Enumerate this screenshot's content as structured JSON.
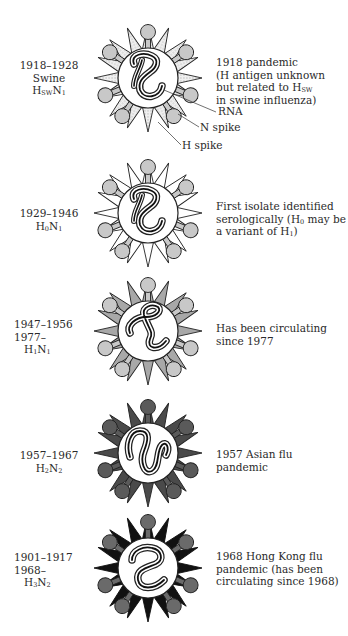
{
  "figure": {
    "entries": [
      {
        "years": [
          "1918–1928"
        ],
        "strain_line": "Swine",
        "subtype": {
          "h": "H",
          "h_sub": "SW",
          "n": "N",
          "n_sub": "1"
        },
        "description": [
          "1918 pandemic",
          "(H antigen unknown",
          "but related to H",
          "in swine influenza)"
        ],
        "description_sub": "SW",
        "spike_style": "dotted",
        "knob_color": "#c8c8c8"
      },
      {
        "years": [
          "1929–1946"
        ],
        "subtype": {
          "h": "H",
          "h_sub": "0",
          "n": "N",
          "n_sub": "1"
        },
        "description": [
          "First isolate identified",
          "serologically (H",
          " may be",
          "a variant of H",
          ")"
        ],
        "spike_style": "white",
        "knob_color": "#c8c8c8"
      },
      {
        "years": [
          "1947–1956",
          "1977–"
        ],
        "subtype": {
          "h": "H",
          "h_sub": "1",
          "n": "N",
          "n_sub": "1"
        },
        "description": [
          "Has been circulating",
          "since 1977"
        ],
        "spike_style": "light-gray",
        "knob_color": "#c8c8c8"
      },
      {
        "years": [
          "1957–1967"
        ],
        "subtype": {
          "h": "H",
          "h_sub": "2",
          "n": "N",
          "n_sub": "2"
        },
        "description": [
          "1957 Asian flu",
          "pandemic"
        ],
        "spike_style": "dark-gray",
        "knob_color": "#5a5a5a"
      },
      {
        "years": [
          "1901–1917",
          "1968–"
        ],
        "subtype": {
          "h": "H",
          "h_sub": "3",
          "n": "N",
          "n_sub": "2"
        },
        "description": [
          "1968 Hong Kong flu",
          "pandemic (has been",
          "circulating since 1968)"
        ],
        "spike_style": "black",
        "knob_color": "#6a6a6a"
      }
    ],
    "callouts": {
      "rna": "RNA",
      "n_spike": "N spike",
      "h_spike": "H spike"
    },
    "colors": {
      "dotted_spike": "#e4e4e4",
      "white_spike": "#ffffff",
      "light_spike": "#a8a8a8",
      "dark_spike": "#4a4a4a",
      "black_spike": "#111111",
      "outline": "#222222"
    }
  }
}
